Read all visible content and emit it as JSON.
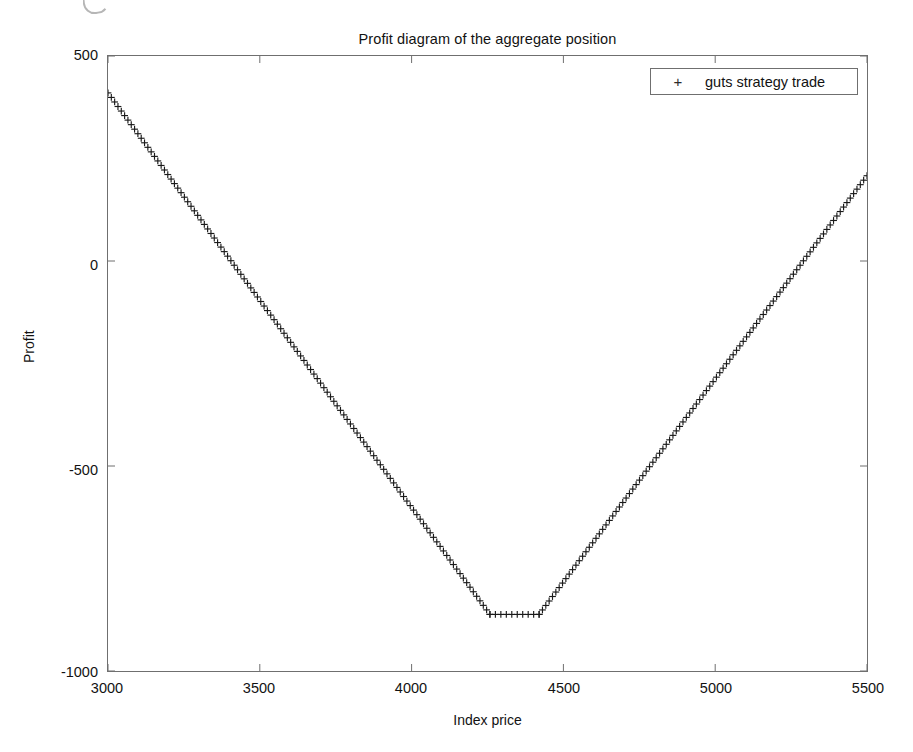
{
  "figure": {
    "title": "Profit diagram of the aggregate position",
    "background": "#ffffff",
    "axis_color": "#6f6f6f",
    "series_color": "#1a1a1a"
  },
  "legend": {
    "marker_glyph": "+",
    "entries": [
      {
        "label": "guts strategy trade",
        "marker": "+"
      }
    ]
  },
  "axes": {
    "x_title": "Index price",
    "y_title": "Profit",
    "x_ticks": [
      "3000",
      "3500",
      "4000",
      "4500",
      "5000",
      "5500"
    ],
    "y_ticks": [
      "500",
      "0",
      "-500",
      "-1000"
    ]
  },
  "chart_data": {
    "type": "line",
    "title": "Profit diagram of the aggregate position",
    "xlabel": "Index price",
    "ylabel": "Profit",
    "xlim": [
      3000,
      5500
    ],
    "ylim": [
      -1000,
      500
    ],
    "xticks": [
      3000,
      3500,
      4000,
      4500,
      5000,
      5500
    ],
    "yticks": [
      -1000,
      -500,
      0,
      500
    ],
    "grid": false,
    "legend_position": "upper right",
    "marker": "+",
    "series": [
      {
        "name": "guts strategy trade",
        "marker": "+",
        "color": "#1a1a1a",
        "x": [
          3000,
          3025,
          3050,
          3075,
          3100,
          3125,
          3150,
          3175,
          3200,
          3225,
          3250,
          3275,
          3300,
          3325,
          3350,
          3375,
          3400,
          3425,
          3450,
          3475,
          3500,
          3525,
          3550,
          3575,
          3600,
          3625,
          3650,
          3675,
          3700,
          3725,
          3750,
          3775,
          3800,
          3825,
          3850,
          3875,
          3900,
          3925,
          3950,
          3975,
          4000,
          4025,
          4050,
          4075,
          4100,
          4125,
          4150,
          4175,
          4200,
          4225,
          4250,
          4262,
          4275,
          4300,
          4325,
          4350,
          4375,
          4400,
          4420,
          4440,
          4460,
          4480,
          4500,
          4525,
          4550,
          4575,
          4600,
          4625,
          4650,
          4675,
          4700,
          4725,
          4750,
          4775,
          4800,
          4825,
          4850,
          4875,
          4900,
          4925,
          4950,
          4975,
          5000,
          5025,
          5050,
          5075,
          5100,
          5125,
          5150,
          5175,
          5200,
          5225,
          5250,
          5275,
          5300,
          5325,
          5350,
          5375,
          5400,
          5425,
          5450,
          5475,
          5500
        ],
        "y": [
          410,
          400,
          390,
          380,
          370,
          360,
          350,
          340,
          330,
          320,
          310,
          300,
          290,
          280,
          270,
          260,
          250,
          240,
          230,
          220,
          210,
          200,
          190,
          180,
          170,
          160,
          150,
          140,
          130,
          120,
          110,
          100,
          90,
          80,
          70,
          60,
          50,
          40,
          30,
          20,
          10,
          0,
          -10,
          -20,
          -30,
          -40,
          -50,
          -60,
          -70,
          -80,
          -90,
          -862,
          -862,
          -862,
          -862,
          -862,
          -862,
          -862,
          -862,
          -840,
          -818,
          -796,
          -774,
          -746,
          -719,
          -692,
          -665,
          -638,
          -611,
          -584,
          -557,
          -530,
          -503,
          -476,
          -449,
          -422,
          -395,
          -368,
          -341,
          -314,
          -287,
          -260,
          -233,
          -206,
          -179,
          -152,
          -125,
          -98,
          -71,
          -44,
          -17,
          10,
          37,
          64,
          91,
          118,
          145,
          160,
          172,
          183,
          193,
          201,
          208
        ],
        "breakpoints": {
          "left_start": {
            "x": 3000,
            "y": 410
          },
          "floor_start": {
            "x": 4258,
            "y": -862
          },
          "floor_end": {
            "x": 4420,
            "y": -862
          },
          "right_end": {
            "x": 5500,
            "y": 208
          }
        },
        "description": "V-shaped payoff with a flat minimum floor of about -862 between index prices 4258 and 4420; linear decline on the left wing from +410 at 3000, linear rise on the right wing to +208 at 5500."
      }
    ]
  }
}
